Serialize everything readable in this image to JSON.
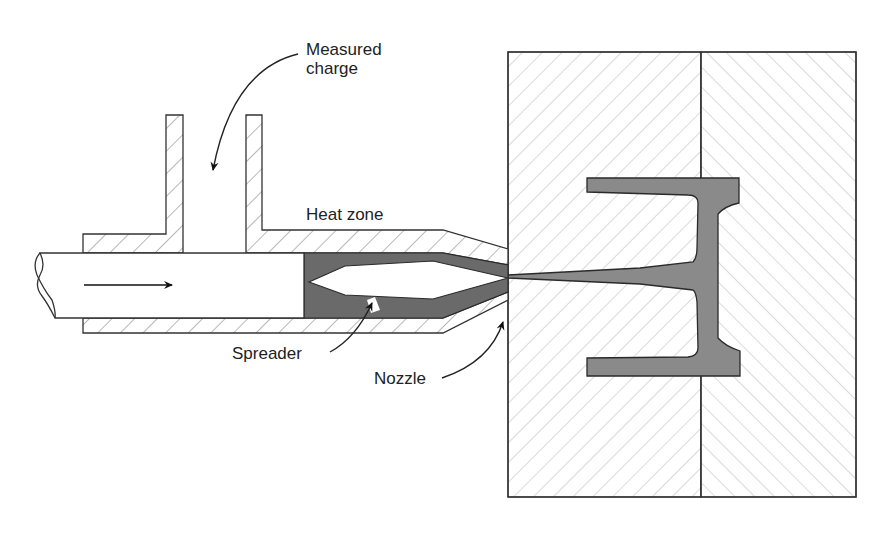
{
  "figure": {
    "type": "transfer/injection molding schematic",
    "labels": {
      "measured_charge_line1": "Measured",
      "measured_charge_line2": "charge",
      "heat_zone": "Heat zone",
      "spreader": "Spreader",
      "nozzle": "Nozzle"
    },
    "components": [
      {
        "id": "plunger",
        "name": "Plunger / ram"
      },
      {
        "id": "feed-port",
        "name": "Charge feed port"
      },
      {
        "id": "barrel",
        "name": "Heated barrel"
      },
      {
        "id": "spreader",
        "name": "Spreader (torpedo)"
      },
      {
        "id": "nozzle",
        "name": "Nozzle"
      },
      {
        "id": "mold-half-left",
        "name": "Mold half (sprue side)"
      },
      {
        "id": "mold-half-right",
        "name": "Mold half (ejector side)"
      },
      {
        "id": "molded-part",
        "name": "Molded part with sprue"
      }
    ],
    "colors": {
      "background": "#ffffff",
      "outline": "#333333",
      "hatch": "#999999",
      "molding_material": "#6a6a6a",
      "molded_part": "#8a8a8a"
    }
  }
}
